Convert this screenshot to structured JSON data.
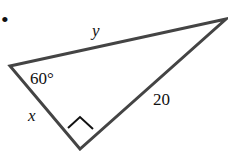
{
  "figure": {
    "bullet": "•",
    "vertices": {
      "left": [
        10,
        66
      ],
      "top_right": [
        226,
        19
      ],
      "bottom": [
        80,
        149
      ]
    },
    "labels": {
      "hypotenuse": "y",
      "left_leg": "x",
      "right_leg": "20",
      "angle": "60°"
    },
    "right_angle_at": "bottom",
    "colors": {
      "stroke": "#444444",
      "text": "#111111"
    }
  }
}
